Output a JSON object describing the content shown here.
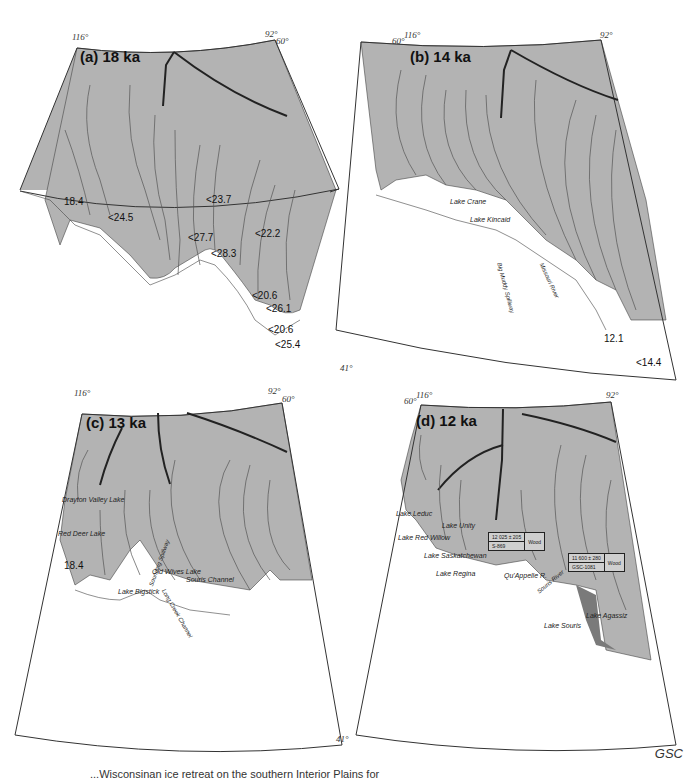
{
  "figure": {
    "credit": "GSC",
    "caption_partial": "...Wisconsinan ice retreat on the southern Interior Plains for",
    "colors": {
      "ice": "#b3b3b3",
      "lake": "#7a7a7a",
      "land": "#ffffff",
      "line": "#333333"
    }
  },
  "panels": [
    {
      "id": "a",
      "title": "(a) 18 ka",
      "coords": {
        "nw": "116°",
        "ne_lon": "92°",
        "ne_lat": "60°",
        "se_lat": "41°"
      },
      "dates": [
        "18.4",
        "<24.5",
        "<23.7",
        "<27.7",
        "<22.2",
        "<28.3",
        "<20.6",
        "<26.1",
        "<20.6",
        "<25.4"
      ]
    },
    {
      "id": "b",
      "title": "(b) 14 ka",
      "coords": {
        "nw": "116°",
        "nw_lat": "60°",
        "ne_lon": "92°"
      },
      "places": [
        "Lake Crane",
        "Lake Kincaid",
        "Big Muddy Spillway",
        "Missouri River"
      ],
      "dates": [
        "12.1",
        "<14.4"
      ]
    },
    {
      "id": "c",
      "title": "(c) 13 ka",
      "coords": {
        "nw": "116°",
        "ne_lon": "92°",
        "ne_lat": "60°",
        "se_lat": "41°"
      },
      "places": [
        "Drayton Valley Lake",
        "Red Deer Lake",
        "Lake Bigstick",
        "Old Wives Lake",
        "Long Creek Channel",
        "Souris Channel",
        "Sounding Spillway"
      ],
      "dates": [
        "18.4"
      ]
    },
    {
      "id": "d",
      "title": "(d) 12 ka",
      "coords": {
        "nw": "116°",
        "nw_lat": "60°",
        "ne_lon": "92°"
      },
      "places": [
        "Lake Leduc",
        "Lake Red Willow",
        "Lake Unity",
        "Lake Saskatchewan",
        "Lake Regina",
        "Qu'Appelle R.",
        "Lake Souris",
        "Lake Agassiz",
        "Souris River"
      ],
      "radiocarbon": [
        {
          "age": "12 025 ± 205",
          "lab": "S-869",
          "material": "Wood"
        },
        {
          "age": "11 600 ± 280",
          "lab": "GSC-1081",
          "material": "Wood"
        }
      ]
    }
  ]
}
